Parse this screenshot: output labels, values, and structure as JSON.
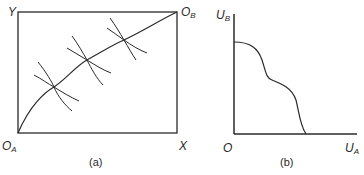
{
  "panel_a": {
    "caption": "(a)",
    "labels": {
      "y_axis": "Y",
      "x_axis": "X",
      "origin_a_main": "O",
      "origin_a_sub": "A",
      "origin_b_main": "O",
      "origin_b_sub": "B"
    },
    "description": "Edgeworth box with contract curve from O_A to O_B and three pairs of tangent indifference curves"
  },
  "panel_b": {
    "caption": "(b)",
    "labels": {
      "origin": "O",
      "y_axis_main": "U",
      "y_axis_sub": "B",
      "x_axis_main": "U",
      "x_axis_sub": "A"
    },
    "description": "Utility possibility frontier plotted in U_A–U_B space"
  },
  "colors": {
    "line": "#2a2a2a",
    "background": "#ffffff"
  }
}
